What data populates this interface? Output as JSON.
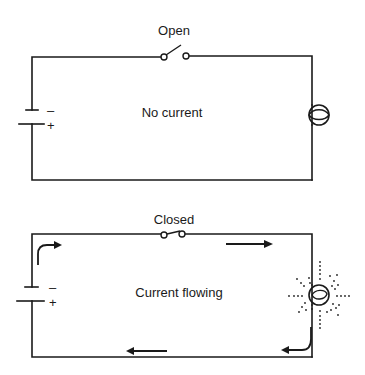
{
  "diagram": {
    "colors": {
      "line": "#1a1a1a",
      "background": "#ffffff"
    },
    "circuits": [
      {
        "id": "open-circuit",
        "switch_label": "Open",
        "center_label": "No current",
        "battery_signs": {
          "negative": "–",
          "positive": "+"
        },
        "switch_state": "open",
        "bulb_state": "off",
        "current_arrows": []
      },
      {
        "id": "closed-circuit",
        "switch_label": "Closed",
        "center_label": "Current flowing",
        "battery_signs": {
          "negative": "–",
          "positive": "+"
        },
        "switch_state": "closed",
        "bulb_state": "lit",
        "current_arrows": [
          "left-top-corner-curved",
          "top-right",
          "bulb-bottom-curved",
          "bottom-left"
        ]
      }
    ]
  }
}
